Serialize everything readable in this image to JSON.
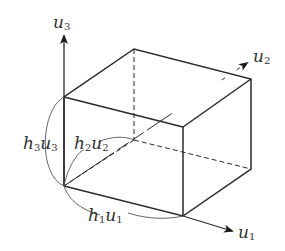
{
  "diagram": {
    "type": "coordinate-box",
    "axes": [
      {
        "id": "u1",
        "base": "u",
        "sub": "1"
      },
      {
        "id": "u2",
        "base": "u",
        "sub": "2"
      },
      {
        "id": "u3",
        "base": "u",
        "sub": "3"
      }
    ],
    "edge_labels": [
      {
        "id": "h1u1",
        "h": "h",
        "hsub": "1",
        "u": "u",
        "usub": "1"
      },
      {
        "id": "h2u2",
        "h": "h",
        "hsub": "2",
        "u": "u",
        "usub": "2"
      },
      {
        "id": "h3u3",
        "h": "h",
        "hsub": "3",
        "u": "u",
        "usub": "3"
      }
    ],
    "colors": {
      "line": "#2a2a2a",
      "text": "#333333",
      "background": "#ffffff"
    }
  }
}
